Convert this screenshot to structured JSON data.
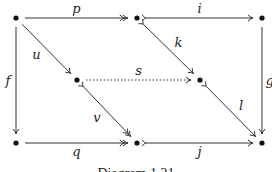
{
  "diagram": {
    "type": "commutative-diagram",
    "caption": "Diagram 1.21",
    "nodes": [
      {
        "id": "A",
        "label": "•",
        "row": 0,
        "col": 0
      },
      {
        "id": "B",
        "label": "•",
        "row": 0,
        "col": 2
      },
      {
        "id": "C",
        "label": "•",
        "row": 0,
        "col": 4
      },
      {
        "id": "D",
        "label": "•",
        "row": 1,
        "col": 1
      },
      {
        "id": "E",
        "label": "•",
        "row": 1,
        "col": 3
      },
      {
        "id": "F",
        "label": "•",
        "row": 2,
        "col": 0
      },
      {
        "id": "G",
        "label": "•",
        "row": 2,
        "col": 2
      },
      {
        "id": "H",
        "label": "•",
        "row": 2,
        "col": 4
      }
    ],
    "edges": [
      {
        "id": "p",
        "label": "p",
        "from": "A",
        "to": "B",
        "style": "solid",
        "head": "double",
        "tail": "none",
        "label_side": "above"
      },
      {
        "id": "i",
        "label": "i",
        "from": "B",
        "to": "C",
        "style": "solid",
        "head": "single",
        "tail": "mono",
        "label_side": "above"
      },
      {
        "id": "f",
        "label": "f",
        "from": "A",
        "to": "F",
        "style": "solid",
        "head": "single",
        "tail": "none",
        "label_side": "left"
      },
      {
        "id": "g",
        "label": "g",
        "from": "C",
        "to": "H",
        "style": "solid",
        "head": "single",
        "tail": "none",
        "label_side": "right"
      },
      {
        "id": "u",
        "label": "u",
        "from": "A",
        "to": "D",
        "style": "solid",
        "head": "single",
        "tail": "none",
        "label_side": "left"
      },
      {
        "id": "k",
        "label": "k",
        "from": "B",
        "to": "E",
        "style": "solid",
        "head": "single",
        "tail": "mono",
        "label_side": "right"
      },
      {
        "id": "s",
        "label": "s",
        "from": "D",
        "to": "E",
        "style": "dotted",
        "head": "single",
        "tail": "none",
        "label_side": "above"
      },
      {
        "id": "v",
        "label": "v",
        "from": "D",
        "to": "G",
        "style": "solid",
        "head": "double",
        "tail": "mono",
        "label_side": "left"
      },
      {
        "id": "l",
        "label": "l",
        "from": "E",
        "to": "H",
        "style": "solid",
        "head": "single",
        "tail": "mono",
        "label_side": "right"
      },
      {
        "id": "q",
        "label": "q",
        "from": "F",
        "to": "G",
        "style": "solid",
        "head": "double",
        "tail": "none",
        "label_side": "below"
      },
      {
        "id": "j",
        "label": "j",
        "from": "G",
        "to": "H",
        "style": "solid",
        "head": "single",
        "tail": "mono",
        "label_side": "below"
      }
    ]
  }
}
